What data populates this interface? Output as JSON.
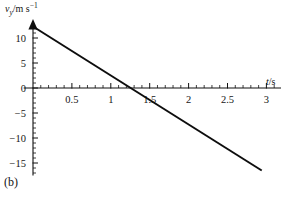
{
  "figure": {
    "panel_label": "(b)",
    "background_color": "#ffffff",
    "line_color": "#0d0d0d",
    "axis_color": "#101010"
  },
  "labels": {
    "y_axis_variable": "v",
    "y_axis_subscript": "y",
    "y_axis_unit": "/m s",
    "y_axis_unit_exponent": "−1",
    "x_axis_variable": "t",
    "x_axis_unit": "/s"
  },
  "chart_data": {
    "type": "line",
    "title": "",
    "subtitle": "",
    "xlabel": "t/s",
    "ylabel": "v_y /m s⁻¹",
    "xlim": [
      -0.12,
      3.32
    ],
    "ylim": [
      -17.5,
      13.6
    ],
    "grid": false,
    "legend": null,
    "x_ticks_major": [
      0.5,
      1,
      1.5,
      2,
      2.5,
      3
    ],
    "x_tick_labels": [
      "0.5",
      "1",
      "1.5",
      "2",
      "2.5",
      "3"
    ],
    "x_ticks_minor": [
      0.1,
      0.2,
      0.3,
      0.4,
      0.6,
      0.7,
      0.8,
      0.9,
      1.1,
      1.2,
      1.3,
      1.4,
      1.6,
      1.7,
      1.8,
      1.9,
      2.1,
      2.2,
      2.3,
      2.4,
      2.6,
      2.7,
      2.8,
      2.9,
      3.1,
      3.2
    ],
    "y_ticks_major": [
      10,
      5,
      0,
      -5,
      -10,
      -15
    ],
    "y_tick_labels": [
      "10",
      "5",
      "0",
      "−5",
      "−10",
      "−15"
    ],
    "y_ticks_minor": [
      12,
      11,
      9,
      8,
      7,
      6,
      4,
      3,
      2,
      1,
      -1,
      -2,
      -3,
      -4,
      -6,
      -7,
      -8,
      -9,
      -11,
      -12,
      -13,
      -14,
      -16,
      -17
    ],
    "zero_label": "0",
    "series": [
      {
        "name": "vertical velocity",
        "x": [
          0,
          2.94
        ],
        "y": [
          12.3,
          -16.5
        ],
        "x_intercept": 1.255,
        "y_intercept": 12.3,
        "slope": -9.8
      }
    ],
    "annotations": [
      {
        "text": "(b)",
        "position": "bottom-left"
      }
    ]
  }
}
